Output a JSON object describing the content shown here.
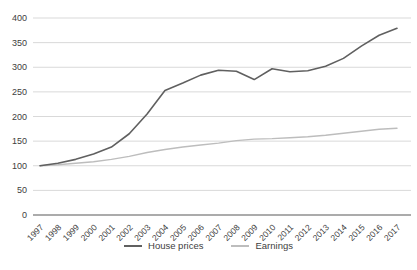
{
  "chart_data": {
    "type": "line",
    "title": "",
    "x": [
      "1997",
      "1998",
      "1999",
      "2000",
      "2001",
      "2002",
      "2003",
      "2004",
      "2005",
      "2006",
      "2007",
      "2008",
      "2009",
      "2010",
      "2011",
      "2012",
      "2013",
      "2014",
      "2015",
      "2016",
      "2017"
    ],
    "series": [
      {
        "name": "House prices",
        "color": "#606060",
        "width": 1.6,
        "values": [
          100,
          105,
          113,
          124,
          138,
          165,
          205,
          253,
          268,
          284,
          294,
          292,
          275,
          297,
          291,
          293,
          302,
          318,
          343,
          365,
          379
        ]
      },
      {
        "name": "Earnings",
        "color": "#bdbdbd",
        "width": 1.4,
        "values": [
          100,
          102,
          105,
          108,
          113,
          119,
          127,
          133,
          138,
          142,
          146,
          151,
          154,
          155,
          157,
          159,
          162,
          166,
          170,
          174,
          176
        ]
      }
    ],
    "ylim": [
      0,
      400
    ],
    "yticks": [
      0,
      50,
      100,
      150,
      200,
      250,
      300,
      350,
      400
    ],
    "grid": true,
    "legend_position": "bottom",
    "colors": {
      "gridline": "#d9d9d9",
      "axis_line": "#595959",
      "tick_text": "#404040",
      "background": "#ffffff"
    }
  }
}
